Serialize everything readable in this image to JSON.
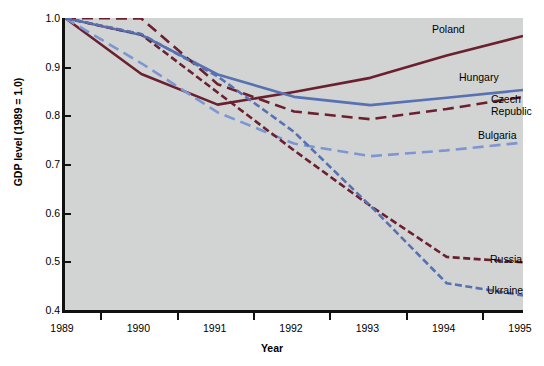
{
  "chart_data": {
    "type": "line",
    "title": "",
    "xlabel": "Year",
    "ylabel": "GDP level (1989 = 1.0)",
    "x": [
      1989,
      1990,
      1991,
      1992,
      1993,
      1994,
      1995
    ],
    "xticklabels": [
      "1989",
      "1990",
      "1991",
      "1992",
      "1993",
      "1994",
      "1995"
    ],
    "yticklabels": [
      "1.0",
      "0.9",
      "0.8",
      "0.7",
      "0.6",
      "0.5",
      "0.4"
    ],
    "yticks": [
      1.0,
      0.9,
      0.8,
      0.7,
      0.6,
      0.5,
      0.4
    ],
    "xlim": [
      1989,
      1995
    ],
    "ylim": [
      0.4,
      1.0
    ],
    "grid": false,
    "legend_position": "inline-right-labels",
    "series": [
      {
        "name": "Poland",
        "color": "#6B2030",
        "style": "solid",
        "values": [
          1.0,
          0.885,
          0.822,
          0.848,
          0.877,
          0.923,
          0.963
        ]
      },
      {
        "name": "Hungary",
        "color": "#5771B2",
        "style": "solid",
        "values": [
          1.0,
          0.965,
          0.884,
          0.838,
          0.821,
          0.836,
          0.852
        ]
      },
      {
        "name": "Czech Republic",
        "color": "#6B2030",
        "style": "dashed",
        "values": [
          1.0,
          0.999,
          0.864,
          0.808,
          0.792,
          0.813,
          0.838
        ]
      },
      {
        "name": "Bulgaria",
        "color": "#7D96D2",
        "style": "dashed",
        "values": [
          1.0,
          0.907,
          0.806,
          0.742,
          0.716,
          0.728,
          0.744
        ]
      },
      {
        "name": "Russia",
        "color": "#6B2030",
        "style": "dotted",
        "values": [
          1.0,
          0.966,
          0.847,
          0.728,
          0.614,
          0.509,
          0.498
        ]
      },
      {
        "name": "Ukraine",
        "color": "#5771B2",
        "style": "dotted",
        "values": [
          1.0,
          0.967,
          0.88,
          0.766,
          0.614,
          0.455,
          0.43
        ]
      }
    ],
    "series_label_positions": [
      {
        "name": "Poland",
        "left": 432,
        "top": 24
      },
      {
        "name": "Hungary",
        "left": 459,
        "top": 72
      },
      {
        "name": "Czech",
        "left": 491,
        "top": 94
      },
      {
        "name": "Republic",
        "left": 491,
        "top": 106
      },
      {
        "name": "Bulgaria",
        "left": 478,
        "top": 130
      },
      {
        "name": "Russia",
        "left": 490,
        "top": 254
      },
      {
        "name": "Ukraine",
        "left": 487,
        "top": 285
      }
    ]
  },
  "axis": {
    "plot_bg_color": "#d2d4d4",
    "frame_color": "#111111"
  }
}
